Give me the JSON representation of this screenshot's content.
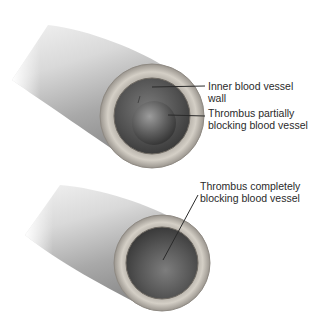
{
  "figure": {
    "panels": [
      {
        "id": "partial",
        "description": "Blood vessel with thrombus partially blocking the lumen",
        "labels": [
          {
            "lines": [
              "Inner blood vessel",
              "wall"
            ]
          },
          {
            "lines": [
              "Thrombus partially",
              "blocking blood vessel"
            ]
          }
        ]
      },
      {
        "id": "complete",
        "description": "Blood vessel with thrombus completely blocking the lumen",
        "labels": [
          {
            "lines": [
              "Thrombus completely",
              "blocking blood vessel"
            ]
          }
        ]
      }
    ],
    "colors": {
      "vessel_light": "#e6e6e6",
      "vessel_mid": "#b8b8b8",
      "vessel_dark": "#8a8a8a",
      "wall_ring": "#c9c4bc",
      "lumen": "#5a5a5a",
      "thrombus": "#6e6e6e",
      "leader_line": "#2a2a2a",
      "text": "#2a2a2a"
    }
  }
}
